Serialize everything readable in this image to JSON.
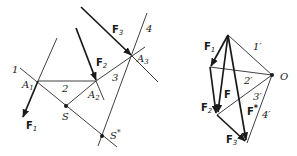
{
  "colors": {
    "ink": "#1a1a1a",
    "background": "#ffffff"
  },
  "left_figure": {
    "points": {
      "A1": "A1",
      "A2": "A2",
      "A3": "A3",
      "S": "S",
      "S_star": "S*"
    },
    "rope_lines": [
      "1",
      "2",
      "3",
      "4"
    ],
    "forces": [
      "F1",
      "F2",
      "F3"
    ]
  },
  "right_figure": {
    "pole": "O",
    "rays": [
      "1'",
      "2'",
      "3'",
      "4'"
    ],
    "forces": [
      "F1",
      "F2",
      "F3"
    ],
    "resultants": [
      "F",
      "F*"
    ]
  },
  "labels": {
    "l_1": "1",
    "l_2": "2",
    "l_3": "3",
    "l_4": "4",
    "A1": "A",
    "A1_sub": "1",
    "A2": "A",
    "A2_sub": "2",
    "A3": "A",
    "A3_sub": "3",
    "S": "S",
    "S_star": "S",
    "S_star_sup": "*",
    "F1": "F",
    "F1_sub": "1",
    "F2": "F",
    "F2_sub": "2",
    "F3": "F",
    "F3_sub": "3",
    "r_1": "1′",
    "r_2": "2′",
    "r_3": "3′",
    "r_4": "4′",
    "O": "O",
    "rF1": "F",
    "rF1_sub": "1",
    "rF2": "F",
    "rF2_sub": "2",
    "rF3": "F",
    "rF3_sub": "3",
    "rF": "F",
    "rFstar": "F",
    "rFstar_sup": "*"
  }
}
